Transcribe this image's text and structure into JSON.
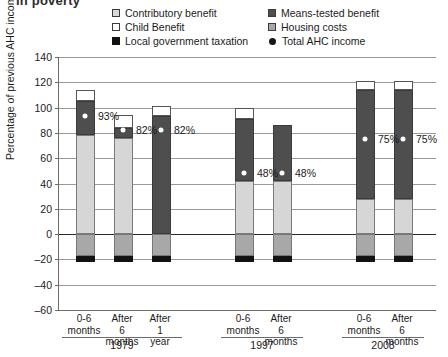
{
  "title_remnant": "in poverty",
  "legend": {
    "items": [
      {
        "label": "Contributory benefit",
        "swatch": "square-light-gray-icon",
        "column": "left"
      },
      {
        "label": "Means-tested benefit",
        "swatch": "square-dark-gray-icon",
        "column": "right"
      },
      {
        "label": "Child Benefit",
        "swatch": "square-white-icon",
        "column": "left"
      },
      {
        "label": "Housing costs",
        "swatch": "square-mid-gray-icon",
        "column": "right"
      },
      {
        "label": "Local government taxation",
        "swatch": "square-black-icon",
        "column": "left"
      },
      {
        "label": "Total AHC income",
        "swatch": "dot-marker-icon",
        "column": "right"
      }
    ]
  },
  "chart_data": {
    "type": "bar",
    "stacked": true,
    "title": "",
    "xlabel": "",
    "ylabel": "Percentage of previous AHC income",
    "ylim": [
      -60,
      140
    ],
    "yticks": [
      140,
      120,
      100,
      80,
      60,
      40,
      20,
      0,
      -20,
      -40,
      -60
    ],
    "grid": true,
    "legend_position": "top",
    "categories": [
      "0-6 months",
      "After 6 months",
      "After 1 year",
      "0-6 months",
      "After 6 months",
      "0-6 months",
      "After 6 months"
    ],
    "groups": [
      {
        "label": "1979",
        "members": [
          "0-6 months",
          "After 6 months",
          "After 1 year"
        ]
      },
      {
        "label": "1997",
        "members": [
          "0-6 months",
          "After 6 months"
        ]
      },
      {
        "label": "2008",
        "members": [
          "0-6 months",
          "After 6 months"
        ]
      }
    ],
    "series": [
      {
        "name": "Contributory benefit",
        "color": "#d6d6d6",
        "values": [
          78,
          76,
          0,
          42,
          42,
          28,
          28
        ]
      },
      {
        "name": "Means-tested benefit",
        "color": "#4e4e4e",
        "values": [
          27,
          8,
          93,
          49,
          44,
          86,
          86
        ]
      },
      {
        "name": "Child Benefit",
        "color": "#ffffff",
        "values": [
          9,
          10,
          8,
          9,
          0,
          7,
          7
        ]
      },
      {
        "name": "Housing costs",
        "color": "#a8a8a8",
        "values": [
          -17,
          -17,
          -17,
          -17,
          -17,
          -17,
          -17
        ]
      },
      {
        "name": "Local government taxation",
        "color": "#121212",
        "values": [
          -5,
          -5,
          -5,
          -5,
          -5,
          -5,
          -5
        ]
      }
    ],
    "markers": {
      "name": "Total AHC income",
      "color": "#ffffff",
      "points": [
        {
          "category_index": 0,
          "value": 93,
          "label": "93%"
        },
        {
          "category_index": 1,
          "value": 82,
          "label": "82%"
        },
        {
          "category_index": 2,
          "value": 82,
          "label": "82%"
        },
        {
          "category_index": 3,
          "value": 48,
          "label": "48%"
        },
        {
          "category_index": 4,
          "value": 48,
          "label": "48%"
        },
        {
          "category_index": 5,
          "value": 75,
          "label": "75%"
        },
        {
          "category_index": 6,
          "value": 75,
          "label": "75%"
        }
      ]
    }
  }
}
